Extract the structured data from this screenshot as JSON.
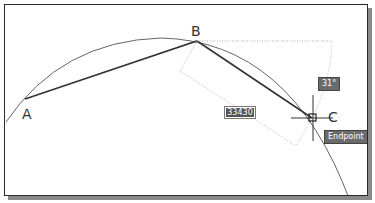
{
  "drawing": {
    "points": {
      "a": "A",
      "b": "B",
      "c": "C"
    },
    "dimension_input": "33430",
    "angle_tooltip": "31°",
    "snap_tooltip": "Endpoint",
    "colors": {
      "line": "#333333",
      "arc": "#555555",
      "guide": "#aaaaaa",
      "tooltip_bg": "#6b6b6b"
    }
  }
}
